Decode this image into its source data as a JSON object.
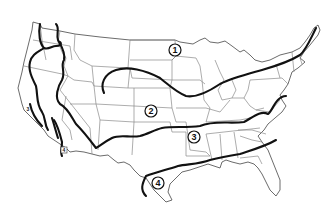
{
  "map": {
    "type": "zone-map",
    "region": "Contiguous United States",
    "colors": {
      "background": "#ffffff",
      "state_borders": "#8a8a8a",
      "zone_lines": "#111111"
    },
    "zone_labels": [
      {
        "id": "zone-1",
        "text": "1",
        "style": "circled",
        "x": 175,
        "y": 50
      },
      {
        "id": "zone-2",
        "text": "2",
        "style": "circled",
        "x": 151,
        "y": 111
      },
      {
        "id": "zone-3",
        "text": "3",
        "style": "circled",
        "x": 194,
        "y": 137
      },
      {
        "id": "zone-4",
        "text": "4",
        "style": "circled",
        "x": 158,
        "y": 183
      },
      {
        "id": "zone-4-ca",
        "text": "4",
        "style": "boxed-small",
        "x": 64,
        "y": 150
      },
      {
        "id": "zone-3-ca",
        "text": "3",
        "style": "small",
        "x": 28,
        "y": 109
      }
    ]
  }
}
